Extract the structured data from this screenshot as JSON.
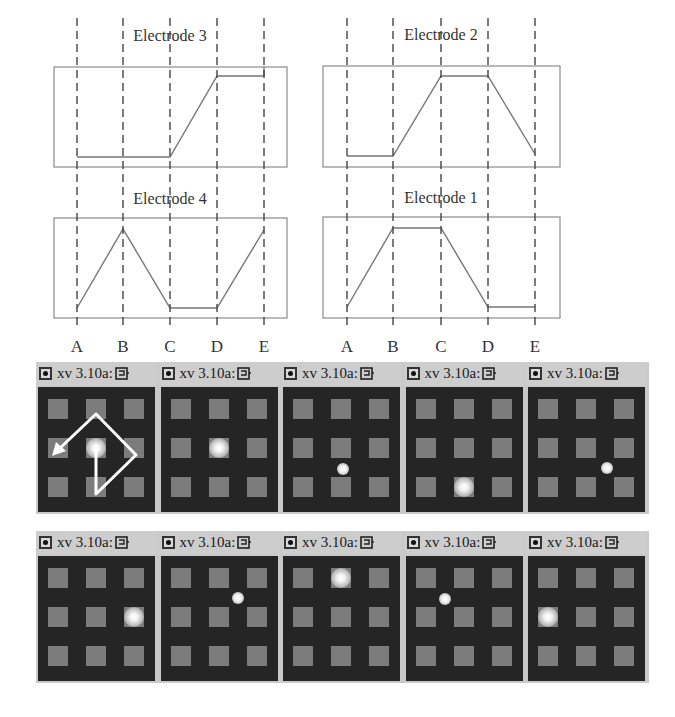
{
  "figure": {
    "waveform_labels": [
      "A",
      "B",
      "C",
      "D",
      "E"
    ],
    "electrodes": [
      {
        "title": "Electrode 3",
        "position": "top-left",
        "levels": [
          "low",
          "low",
          "low",
          "high",
          "high"
        ]
      },
      {
        "title": "Electrode 2",
        "position": "top-right",
        "levels": [
          "low",
          "low",
          "high",
          "high",
          "low"
        ]
      },
      {
        "title": "Electrode 4",
        "position": "bottom-left",
        "levels": [
          "low",
          "high",
          "low",
          "low",
          "high"
        ]
      },
      {
        "title": "Electrode 1",
        "position": "bottom-right",
        "levels": [
          "low",
          "high",
          "high",
          "low",
          "low"
        ]
      }
    ]
  },
  "window_title": "xv 3.10a:",
  "colors": {
    "screen_bg": "#252525",
    "electrode_pad": "#7c7c7c",
    "titlebar": "#cdcdcd",
    "droplet": "#ffffff"
  },
  "rows": [
    {
      "panels": [
        {
          "title": "xv 3.10a:",
          "droplet": {
            "col": 1,
            "row": 1,
            "on_pad": true
          },
          "arrow_path": true
        },
        {
          "title": "xv 3.10a:",
          "droplet": {
            "col": 1,
            "row": 1,
            "on_pad": true
          }
        },
        {
          "title": "xv 3.10a:",
          "droplet": {
            "col": 1.05,
            "row": 1.55,
            "on_pad": false
          }
        },
        {
          "title": "xv 3.10a:",
          "droplet": {
            "col": 1,
            "row": 2,
            "on_pad": true
          }
        },
        {
          "title": "xv 3.10a:",
          "droplet": {
            "col": 1.55,
            "row": 1.5,
            "on_pad": false
          }
        }
      ]
    },
    {
      "panels": [
        {
          "title": "xv 3.10a:",
          "droplet": {
            "col": 2,
            "row": 1,
            "on_pad": true
          }
        },
        {
          "title": "xv 3.10a:",
          "droplet": {
            "col": 1.5,
            "row": 0.5,
            "on_pad": false
          }
        },
        {
          "title": "xv 3.10a:",
          "droplet": {
            "col": 1,
            "row": 0,
            "on_pad": true
          }
        },
        {
          "title": "xv 3.10a:",
          "droplet": {
            "col": 0.5,
            "row": 0.55,
            "on_pad": false
          }
        },
        {
          "title": "xv 3.10a:",
          "droplet": {
            "col": 0,
            "row": 1,
            "on_pad": true
          }
        }
      ]
    }
  ]
}
